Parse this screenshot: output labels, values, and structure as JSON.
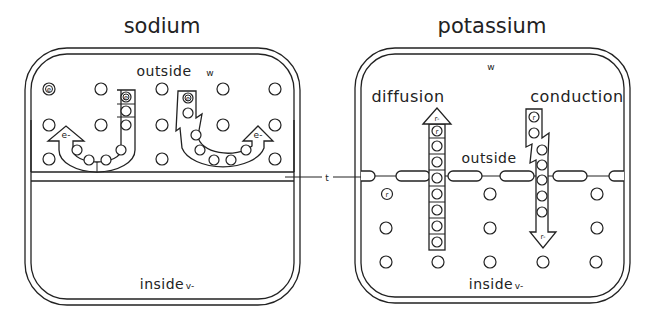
{
  "panels": {
    "sodium": {
      "title": "sodium",
      "outside_label": "outside",
      "outside_symbol": "w",
      "inside_label": "inside",
      "inside_symbol": "v-",
      "left_arrow_tip": "e-",
      "right_arrow_tip": "e-",
      "marked_particle": "e"
    },
    "potassium": {
      "title": "potassium",
      "top_symbol": "w",
      "diffusion_label": "diffusion",
      "conduction_label": "conduction",
      "outside_label": "outside",
      "inside_label": "inside",
      "inside_symbol": "v-",
      "diffusion_arrow_tip": "r-",
      "conduction_arrow_tip": "r-",
      "marked_particle": "r"
    }
  },
  "connector_label": "t"
}
